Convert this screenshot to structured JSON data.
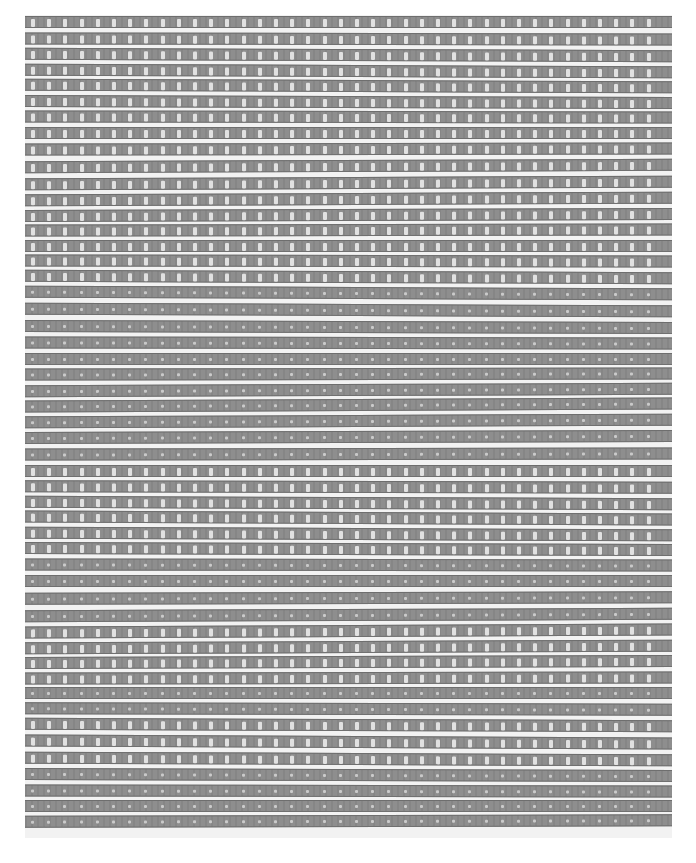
{
  "image": {
    "subject": "woven textile with horizontal weft bands and rectangular openings",
    "colors": {
      "background": "#ffffff",
      "band": "#8e8e8e",
      "band_edge": "#6e6e6e",
      "gap": "#f2f2f2",
      "hole": "#e6e6e6"
    },
    "fabric": {
      "left": 25,
      "top": 15,
      "width": 647,
      "height": 823
    },
    "band_pitch": 16,
    "hole_pitch": 16.2,
    "band_count": 51
  }
}
